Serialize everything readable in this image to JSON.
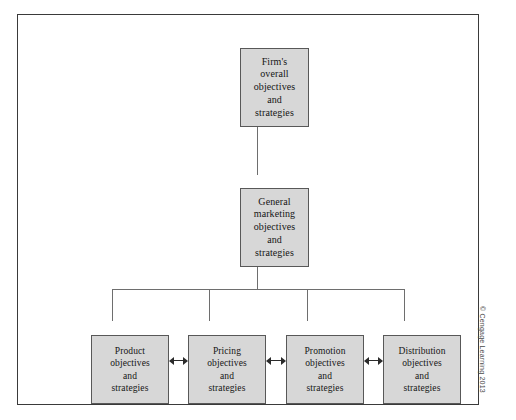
{
  "diagram": {
    "type": "hierarchy-tree",
    "levels": [
      {
        "level": 1,
        "nodes": [
          {
            "id": "firm",
            "label": "Firm's\noverall\nobjectives\nand\nstrategies"
          }
        ]
      },
      {
        "level": 2,
        "nodes": [
          {
            "id": "marketing",
            "label": "General\nmarketing\nobjectives\nand\nstrategies"
          }
        ]
      },
      {
        "level": 3,
        "nodes": [
          {
            "id": "product",
            "label": "Product\nobjectives\nand\nstrategies"
          },
          {
            "id": "pricing",
            "label": "Pricing\nobjectives\nand\nstrategies"
          },
          {
            "id": "promotion",
            "label": "Promotion\nobjectives\nand\nstrategies"
          },
          {
            "id": "distribution",
            "label": "Distribution\nobjectives\nand\nstrategies"
          }
        ]
      }
    ],
    "connectors": [
      {
        "from": "marketing",
        "to": "firm",
        "style": "single-arrow-up"
      },
      {
        "from": "mix-bus",
        "to": "marketing",
        "style": "single-arrow-up"
      },
      {
        "from": "product",
        "to": "pricing",
        "style": "double-arrow-horizontal"
      },
      {
        "from": "pricing",
        "to": "promotion",
        "style": "double-arrow-horizontal"
      },
      {
        "from": "promotion",
        "to": "distribution",
        "style": "double-arrow-horizontal"
      }
    ]
  },
  "colors": {
    "box_fill": "#d7d7d7",
    "box_border": "#585858",
    "frame_border": "#3a3a3a",
    "connector": "#6e6e6e",
    "arrow": "#2b2b2b",
    "text": "#151515"
  },
  "credit": "© Cengage Learning 2013"
}
